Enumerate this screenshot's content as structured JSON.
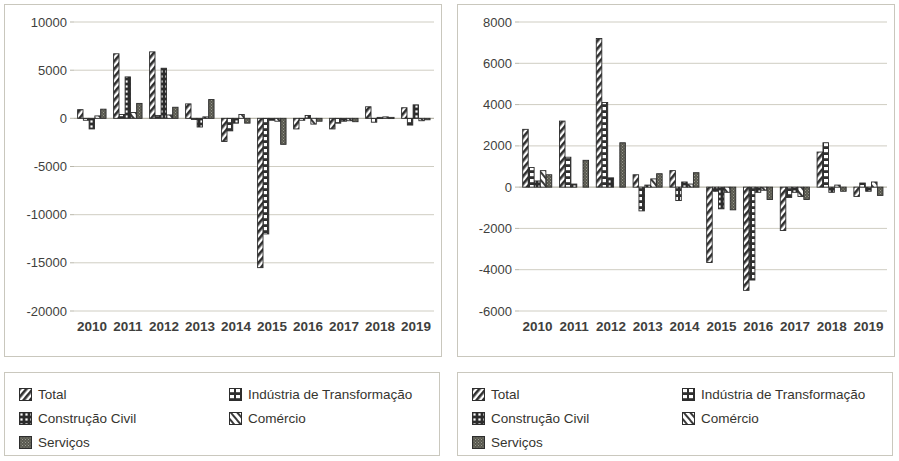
{
  "figure": {
    "panels": [
      "left",
      "right"
    ]
  },
  "legend": {
    "items": [
      {
        "label": "Total",
        "pattern": "diagonal-hatch",
        "swatch": "swatch-total"
      },
      {
        "label": "Indústria de Transformação",
        "pattern": "horizontal-bricks",
        "swatch": "swatch-industria"
      },
      {
        "label": "Construção Civil",
        "pattern": "dotted-dark",
        "swatch": "swatch-construcao"
      },
      {
        "label": "Comércio",
        "pattern": "diagonal-light",
        "swatch": "swatch-comercio"
      },
      {
        "label": "Serviços",
        "pattern": "solid-speckle",
        "swatch": "swatch-servicos"
      }
    ]
  },
  "chart_data": [
    {
      "type": "bar",
      "id": "left-chart",
      "title": "",
      "xlabel": "",
      "ylabel": "",
      "grid": true,
      "legend_position": "bottom",
      "categories": [
        "2010",
        "2011",
        "2012",
        "2013",
        "2014",
        "2015",
        "2016",
        "2017",
        "2018",
        "2019"
      ],
      "ylim": [
        -20000,
        10000
      ],
      "yticks": [
        10000,
        5000,
        0,
        -5000,
        -10000,
        -15000,
        -20000
      ],
      "ytick_labels": [
        "10000",
        "5000",
        "0",
        "-5000",
        "-10000",
        "-15000",
        "-20000"
      ],
      "series": [
        {
          "name": "Total",
          "values": [
            900,
            6700,
            6900,
            1500,
            -2400,
            -15500,
            -1100,
            -1100,
            1200,
            1100
          ]
        },
        {
          "name": "Indústria de Transformação",
          "values": [
            -200,
            400,
            300,
            -100,
            -1300,
            -12000,
            -200,
            -500,
            -400,
            -700
          ]
        },
        {
          "name": "Construção Civil",
          "values": [
            -1100,
            4300,
            5200,
            -900,
            -500,
            -200,
            300,
            -300,
            100,
            1400
          ]
        },
        {
          "name": "Comércio",
          "values": [
            250,
            600,
            350,
            150,
            400,
            -300,
            -600,
            -250,
            150,
            -250
          ]
        },
        {
          "name": "Serviços",
          "values": [
            950,
            1550,
            1150,
            1950,
            -500,
            -2700,
            -300,
            -350,
            100,
            -150
          ]
        }
      ]
    },
    {
      "type": "bar",
      "id": "right-chart",
      "title": "",
      "xlabel": "",
      "ylabel": "",
      "grid": true,
      "legend_position": "bottom",
      "categories": [
        "2010",
        "2011",
        "2012",
        "2013",
        "2014",
        "2015",
        "2016",
        "2017",
        "2018",
        "2019"
      ],
      "ylim": [
        -6000,
        8000
      ],
      "yticks": [
        8000,
        6000,
        4000,
        2000,
        0,
        -2000,
        -4000,
        -6000
      ],
      "ytick_labels": [
        "8000",
        "6000",
        "4000",
        "2000",
        "0",
        "-2000",
        "-4000",
        "-6000"
      ],
      "series": [
        {
          "name": "Total",
          "values": [
            2800,
            3200,
            7200,
            600,
            800,
            -3650,
            -5000,
            -2100,
            1700,
            -450
          ]
        },
        {
          "name": "Indústria de Transformação",
          "values": [
            950,
            1450,
            4100,
            -1150,
            -650,
            -200,
            -4500,
            -500,
            2150,
            200
          ]
        },
        {
          "name": "Construção Civil",
          "values": [
            300,
            150,
            450,
            100,
            250,
            -1050,
            -250,
            -250,
            -250,
            -200
          ]
        },
        {
          "name": "Comércio",
          "values": [
            800,
            0,
            0,
            400,
            150,
            -250,
            -150,
            -450,
            100,
            250
          ]
        },
        {
          "name": "Serviços",
          "values": [
            600,
            1300,
            2150,
            650,
            700,
            -1100,
            -600,
            -600,
            -200,
            -400
          ]
        }
      ]
    }
  ]
}
